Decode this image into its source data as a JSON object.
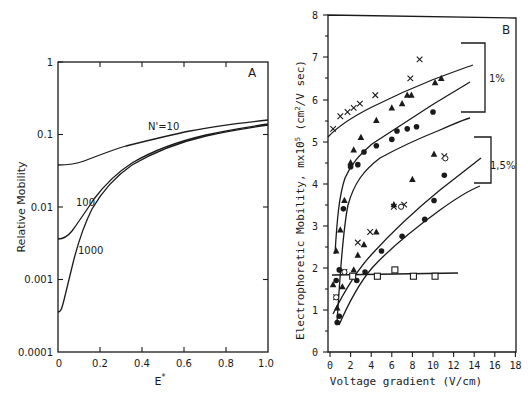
{
  "chart_data": [
    {
      "panel": "A",
      "type": "line",
      "xlabel": "E*",
      "ylabel": "Relative Mobility",
      "xlim": [
        0,
        1.0
      ],
      "ylim": [
        0.0001,
        1
      ],
      "yscale": "log",
      "grid": false,
      "xticks": [
        "0",
        "0.2",
        "0.4",
        "0.6",
        "0.8",
        "1.0"
      ],
      "yticks": [
        "0.0001",
        "0.001",
        "0.01",
        "0.1",
        "1"
      ],
      "series": [
        {
          "name": "N'=10",
          "x": [
            0,
            0.05,
            0.1,
            0.2,
            0.3,
            0.4,
            0.5,
            0.6,
            0.7,
            0.8,
            0.9,
            1.0
          ],
          "values": [
            0.037,
            0.038,
            0.042,
            0.055,
            0.07,
            0.085,
            0.1,
            0.115,
            0.13,
            0.145,
            0.16,
            0.18
          ]
        },
        {
          "name": "100",
          "x": [
            0,
            0.03,
            0.06,
            0.1,
            0.15,
            0.2,
            0.3,
            0.4,
            0.5,
            0.6,
            0.7,
            0.8,
            0.9,
            1.0
          ],
          "values": [
            0.0036,
            0.0042,
            0.0058,
            0.0095,
            0.016,
            0.024,
            0.041,
            0.058,
            0.075,
            0.093,
            0.11,
            0.125,
            0.14,
            0.155
          ]
        },
        {
          "name": "1000",
          "x": [
            0,
            0.02,
            0.04,
            0.07,
            0.1,
            0.15,
            0.2,
            0.3,
            0.4,
            0.5,
            0.6,
            0.7,
            0.8,
            0.9,
            1.0
          ],
          "values": [
            0.00035,
            0.0005,
            0.0013,
            0.0035,
            0.0068,
            0.014,
            0.022,
            0.04,
            0.057,
            0.074,
            0.092,
            0.108,
            0.123,
            0.138,
            0.152
          ]
        }
      ],
      "annotations": [
        "N'=10",
        "100",
        "1000",
        "A"
      ]
    },
    {
      "panel": "B",
      "type": "scatter",
      "xlabel": "Voltage gradient (V/cm)",
      "ylabel": "Electrophoretic Mobility, mx10^5 (cm^2/V sec)",
      "xlim": [
        0,
        18
      ],
      "ylim": [
        0,
        8
      ],
      "grid": false,
      "xticks": [
        "0",
        "2",
        "4",
        "6",
        "8",
        "10",
        "12",
        "14",
        "16",
        "18"
      ],
      "yticks": [
        "0",
        "1",
        "2",
        "3",
        "4",
        "5",
        "6",
        "7",
        "8"
      ],
      "series": [
        {
          "name": "1% crosses",
          "marker": "x",
          "x": [
            0.3,
            1.0,
            1.7,
            2.3,
            2.9,
            4.4,
            7.8,
            8.7
          ],
          "values": [
            5.3,
            5.6,
            5.7,
            5.8,
            5.9,
            6.1,
            6.5,
            6.95
          ],
          "fit_x": [
            0,
            1,
            2,
            4,
            6,
            8,
            10,
            12.5
          ],
          "fit_y": [
            5.1,
            5.5,
            5.75,
            6.1,
            6.4,
            6.65,
            6.85,
            7.05
          ]
        },
        {
          "name": "1% triangles",
          "marker": "filled-triangle",
          "x": [
            0.3,
            0.6,
            1.0,
            1.4,
            2.0,
            2.3,
            3.0,
            4.5,
            6.0,
            7.0,
            7.5,
            7.9,
            10.2,
            10.8
          ],
          "values": [
            1.6,
            2.4,
            2.9,
            3.6,
            4.5,
            4.8,
            5.1,
            5.5,
            5.8,
            5.9,
            6.1,
            6.1,
            6.4,
            6.5
          ],
          "fit_x": [
            0.5,
            0.7,
            1,
            1.5,
            2,
            3,
            4,
            6,
            8,
            10,
            12.5
          ],
          "fit_y": [
            2.4,
            3.6,
            4.2,
            4.6,
            4.9,
            5.2,
            5.45,
            5.8,
            6.05,
            6.3,
            6.6
          ]
        },
        {
          "name": "1% circles",
          "marker": "filled-circle",
          "x": [
            0.6,
            0.9,
            1.3,
            2.0,
            2.7,
            3.3,
            4.5,
            6.0,
            6.5,
            7.5,
            8.4,
            10.0
          ],
          "values": [
            1.7,
            1.95,
            3.4,
            4.4,
            4.45,
            4.75,
            4.9,
            5.05,
            5.25,
            5.3,
            5.35,
            5.7
          ],
          "fit_x": [
            0.7,
            1,
            1.5,
            2,
            3,
            4,
            6,
            8,
            10,
            12.5
          ],
          "fit_y": [
            0.7,
            2.2,
            3.5,
            4.1,
            4.6,
            4.85,
            5.15,
            5.35,
            5.55,
            5.8
          ]
        },
        {
          "name": "1.5% triangles",
          "marker": "filled-triangle",
          "x": [
            0.7,
            1.2,
            2.3,
            2.7,
            3.3,
            4.5,
            6.2,
            8.0,
            10.1
          ],
          "values": [
            1.05,
            1.55,
            1.95,
            2.3,
            2.55,
            2.85,
            3.5,
            4.1,
            4.7
          ],
          "fit_x": [
            0.3,
            1,
            2,
            3,
            4,
            6,
            8,
            10,
            12,
            13.5
          ],
          "fit_y": [
            0.9,
            1.5,
            2.1,
            2.55,
            2.95,
            3.55,
            4.05,
            4.5,
            4.9,
            5.2
          ]
        },
        {
          "name": "1.5% crosses/open",
          "marker": "x-open",
          "x": [
            0.6,
            1.4,
            2.7,
            3.9,
            6.2,
            7.2,
            11.1
          ],
          "values": [
            1.3,
            1.9,
            2.6,
            2.85,
            3.45,
            3.5,
            4.65
          ]
        },
        {
          "name": "1.5% circles",
          "marker": "filled-circle",
          "x": [
            0.7,
            0.9,
            2.6,
            3.4,
            5.0,
            7.0,
            9.2,
            10.1,
            11.1
          ],
          "values": [
            0.7,
            0.85,
            1.7,
            1.9,
            2.4,
            2.75,
            3.15,
            3.6,
            4.2
          ],
          "fit_x": [
            0.9,
            1.5,
            2,
            3,
            4,
            6,
            8,
            10,
            12,
            13.5
          ],
          "fit_y": [
            0.65,
            1.15,
            1.5,
            1.95,
            2.3,
            2.85,
            3.3,
            3.7,
            4.1,
            4.35
          ]
        },
        {
          "name": "open squares",
          "marker": "open-square",
          "x": [
            2.2,
            4.6,
            6.3,
            8.1,
            10.2
          ],
          "values": [
            1.8,
            1.8,
            1.95,
            1.8,
            1.8
          ],
          "fit_x": [
            0.2,
            12.5
          ],
          "fit_y": [
            1.82,
            1.88
          ]
        }
      ],
      "brackets": [
        {
          "label": "1%",
          "y_range": [
            5.6,
            7.2
          ]
        },
        {
          "label": "1,5%",
          "y_range": [
            3.8,
            4.85
          ]
        }
      ],
      "annotations": [
        "B",
        "1%",
        "1,5%"
      ]
    }
  ],
  "panelA": {
    "letter": "A",
    "ylabel": "Relative Mobility",
    "xlabel": "E*",
    "xlabel_sup": "*",
    "xlabel_base": "E",
    "yticks": [
      "1",
      "0.1",
      "0.01",
      "0.001",
      "0.0001"
    ],
    "xticks": [
      "0",
      "0.2",
      "0.4",
      "0.6",
      "0.8",
      "1.0"
    ],
    "curve_labels": [
      "N'=10",
      "100",
      "1000"
    ]
  },
  "panelB": {
    "letter": "B",
    "ylabel_a": "Electrophoretic Mobility, mx10",
    "ylabel_sup1": "5",
    "ylabel_b": " (cm",
    "ylabel_sup2": "2",
    "ylabel_c": "/V sec)",
    "xlabel": "Voltage gradient (V/cm)",
    "yticks": [
      "0",
      "1",
      "2",
      "3",
      "4",
      "5",
      "6",
      "7",
      "8"
    ],
    "xticks": [
      "0",
      "2",
      "4",
      "6",
      "8",
      "10",
      "12",
      "14",
      "16",
      "18"
    ],
    "bracket_1": "1%",
    "bracket_2": "1,5%"
  }
}
